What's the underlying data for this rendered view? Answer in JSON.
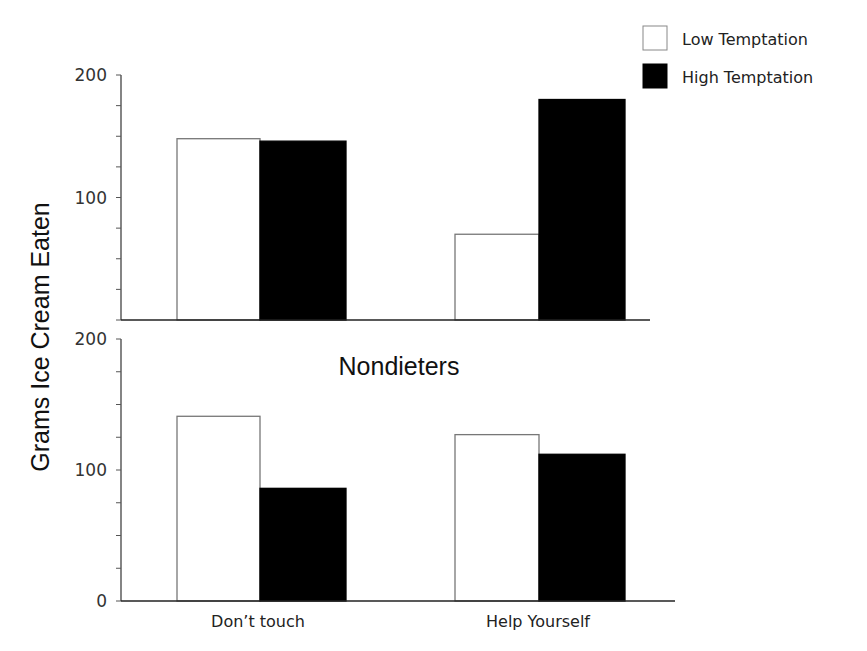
{
  "chart_data": [
    {
      "type": "bar",
      "panel": "top",
      "title": "",
      "categories": [
        "Don’t touch",
        "Help Yourself"
      ],
      "series": [
        {
          "name": "Low Temptation",
          "color": "#ffffff",
          "values": [
            148,
            70
          ]
        },
        {
          "name": "High Temptation",
          "color": "#000000",
          "values": [
            146,
            180
          ]
        }
      ],
      "ylim": [
        0,
        200
      ],
      "yticks": [
        100,
        200
      ],
      "ylabel": "Grams Ice Cream Eaten",
      "grid": false
    },
    {
      "type": "bar",
      "panel": "bottom",
      "title": "Nondieters",
      "categories": [
        "Don’t touch",
        "Help Yourself"
      ],
      "series": [
        {
          "name": "Low Temptation",
          "color": "#ffffff",
          "values": [
            141,
            127
          ]
        },
        {
          "name": "High Temptation",
          "color": "#000000",
          "values": [
            86,
            112
          ]
        }
      ],
      "ylim": [
        0,
        200
      ],
      "yticks": [
        0,
        100,
        200
      ],
      "ylabel": "Grams Ice Cream Eaten",
      "xlabel": "",
      "grid": false
    }
  ],
  "legend": {
    "position": "top-right",
    "items": [
      {
        "label": "Low Temptation",
        "color": "#ffffff"
      },
      {
        "label": "High Temptation",
        "color": "#000000"
      }
    ]
  },
  "ylabel": "Grams Ice Cream Eaten",
  "bottom_title": "Nondieters",
  "x_categories": [
    "Don’t touch",
    "Help Yourself"
  ]
}
